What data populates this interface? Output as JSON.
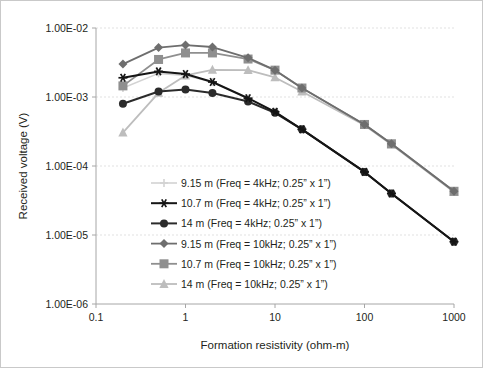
{
  "figure": {
    "background_color": "#ffffff",
    "border_color": "#c9c9c9",
    "axis_color": "#a6a6a6",
    "grid_color": "#d9d9d9",
    "text_color": "#231f20"
  },
  "chart_data": {
    "type": "line",
    "title": "",
    "xlabel": "Formation resistivity (ohm-m)",
    "ylabel": "Received voltage (V)",
    "xscale": "log",
    "yscale": "log",
    "xlim": [
      0.1,
      1000
    ],
    "ylim": [
      1e-06,
      0.01
    ],
    "xticks": [
      0.1,
      1,
      10,
      100,
      1000
    ],
    "xtick_labels": [
      "0.1",
      "1",
      "10",
      "100",
      "1000"
    ],
    "yticks": [
      1e-06,
      1e-05,
      0.0001,
      0.001,
      0.01
    ],
    "ytick_labels": [
      "1.00E-06",
      "1.00E-05",
      "1.00E-04",
      "1.00E-03",
      "1.00E-02"
    ],
    "grid": true,
    "grid_axis": "y",
    "legend_position": "center-left-inside",
    "x": [
      0.2,
      0.5,
      1,
      2,
      5,
      10,
      20,
      100,
      200,
      1000
    ],
    "series": [
      {
        "name": "9.15 m  (Freq = 4kHz; 0.25” x 1”)",
        "color": "#d3d3d3",
        "marker": "plus",
        "marker_size": 4,
        "line_width": 1.6,
        "values": [
          0.00135,
          0.0022,
          0.00205,
          0.00165,
          0.00096,
          0.00061,
          0.00034,
          8.2e-05,
          4e-05,
          8e-06
        ]
      },
      {
        "name": "10.7 m (Freq = 4kHz; 0.25” x 1”)",
        "color": "#151515",
        "marker": "star",
        "marker_size": 4.5,
        "line_width": 2.0,
        "values": [
          0.0019,
          0.00235,
          0.00215,
          0.00165,
          0.00096,
          0.00061,
          0.00034,
          8.2e-05,
          4e-05,
          8e-06
        ]
      },
      {
        "name": "14 m  (Freq = 4kHz; 0.25” x 1”)",
        "color": "#2b2b2b",
        "marker": "circle",
        "marker_size": 4,
        "line_width": 2.0,
        "values": [
          0.0008,
          0.0012,
          0.00128,
          0.00114,
          0.00086,
          0.00059,
          0.00034,
          8.2e-05,
          4e-05,
          8e-06
        ]
      },
      {
        "name": "9.15 m (Freq = 10kHz; 0.25” x 1”)",
        "color": "#6e6e6e",
        "marker": "diamond",
        "marker_size": 4.5,
        "line_width": 1.8,
        "values": [
          0.003,
          0.0052,
          0.00565,
          0.0053,
          0.0037,
          0.00245,
          0.00135,
          0.0004,
          0.00021,
          4.3e-05
        ]
      },
      {
        "name": "10.7 m (Freq = 10kHz; 0.25” x 1”)",
        "color": "#8f8f8f",
        "marker": "square",
        "marker_size": 4.5,
        "line_width": 1.8,
        "values": [
          0.00145,
          0.0035,
          0.00435,
          0.00435,
          0.00355,
          0.00245,
          0.00135,
          0.0004,
          0.00021,
          4.3e-05
        ]
      },
      {
        "name": "14 m  (Freq =  10kHz; 0.25” x 1”)",
        "color": "#bdbdbd",
        "marker": "triangle",
        "marker_size": 5,
        "line_width": 1.8,
        "values": [
          0.000305,
          0.00115,
          0.00205,
          0.00248,
          0.00245,
          0.00192,
          0.0012,
          0.00039,
          0.000205,
          4.2e-05
        ]
      }
    ]
  }
}
